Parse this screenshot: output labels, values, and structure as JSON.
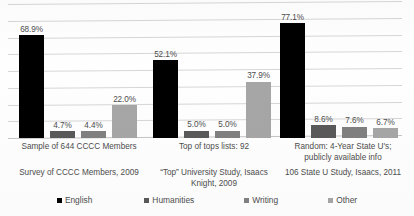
{
  "chart_data": {
    "type": "bar",
    "title": "",
    "subtitle": "",
    "xlabel": "",
    "ylabel": "",
    "ylim": [
      0,
      90
    ],
    "grid": true,
    "gridline_count": 9,
    "legend_position": "bottom",
    "value_suffix": "%",
    "categories": [
      "Sample of 644 CCCC Members",
      "Top of tops lists: 92",
      "Random: 4-Year State U's; publicly available info"
    ],
    "category_sources": [
      "Survey of CCCC Members, 2009",
      "“Top” University Study, Isaacs Knight, 2009",
      "106 State U Study, Isaacs, 2011"
    ],
    "series": [
      {
        "name": "English",
        "color": "#000000",
        "values": [
          68.9,
          52.1,
          77.1
        ],
        "labels": [
          "68.9%",
          "52.1%",
          "77.1%"
        ]
      },
      {
        "name": "Humanities",
        "color": "#595959",
        "values": [
          4.7,
          5.0,
          8.6
        ],
        "labels": [
          "4.7%",
          "5.0%",
          "8.6%"
        ]
      },
      {
        "name": "Writing",
        "color": "#808080",
        "values": [
          4.4,
          5.0,
          7.6
        ],
        "labels": [
          "4.4%",
          "5.0%",
          "7.6%"
        ]
      },
      {
        "name": "Other",
        "color": "#a6a6a6",
        "values": [
          22.0,
          37.9,
          6.7
        ],
        "labels": [
          "22.0%",
          "37.9%",
          "6.7%"
        ]
      }
    ]
  },
  "legend": {
    "items": [
      {
        "label": "English",
        "color": "#000000"
      },
      {
        "label": "Humanities",
        "color": "#595959"
      },
      {
        "label": "Writing",
        "color": "#808080"
      },
      {
        "label": "Other",
        "color": "#a6a6a6"
      }
    ]
  }
}
